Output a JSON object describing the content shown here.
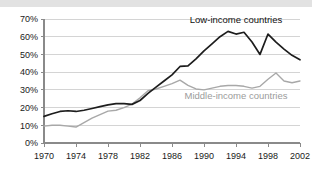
{
  "chart_data": {
    "type": "line",
    "title": "",
    "xlabel": "",
    "ylabel": "",
    "xlim": [
      1970,
      2002
    ],
    "ylim": [
      0,
      70
    ],
    "grid": true,
    "legend_position": "inline-annotation",
    "y_ticks": [
      "0%",
      "10%",
      "20%",
      "30%",
      "40%",
      "50%",
      "60%",
      "70%"
    ],
    "y_tick_values": [
      0,
      10,
      20,
      30,
      40,
      50,
      60,
      70
    ],
    "x_ticks": [
      "1970",
      "1974",
      "1978",
      "1982",
      "1986",
      "1990",
      "1994",
      "1998",
      "2002"
    ],
    "x_tick_values": [
      1970,
      1974,
      1978,
      1982,
      1986,
      1990,
      1994,
      1998,
      2002
    ],
    "x": [
      1970,
      1971,
      1972,
      1973,
      1974,
      1975,
      1976,
      1977,
      1978,
      1979,
      1980,
      1981,
      1982,
      1983,
      1984,
      1985,
      1986,
      1987,
      1988,
      1989,
      1990,
      1991,
      1992,
      1993,
      1994,
      1995,
      1996,
      1997,
      1998,
      1999,
      2000,
      2001,
      2002
    ],
    "series": [
      {
        "name": "Low-income countries",
        "color": "#1d1d1d",
        "values": [
          15.0,
          16.5,
          17.8,
          18.2,
          17.8,
          18.5,
          19.5,
          20.5,
          21.5,
          22.2,
          22.2,
          21.8,
          24.0,
          28.0,
          31.5,
          35.0,
          38.5,
          43.2,
          43.5,
          47.5,
          52.0,
          56.0,
          60.0,
          63.0,
          61.5,
          62.5,
          57.0,
          50.0,
          61.5,
          57.0,
          53.0,
          49.5,
          47.0
        ]
      },
      {
        "name": "Middle-income countries",
        "color": "#a8a8a8",
        "values": [
          9.5,
          10.0,
          10.0,
          9.5,
          9.0,
          11.5,
          14.0,
          16.0,
          18.0,
          18.5,
          20.0,
          22.0,
          25.5,
          29.5,
          30.5,
          32.0,
          33.5,
          35.5,
          32.5,
          30.5,
          30.0,
          31.0,
          32.0,
          32.5,
          32.5,
          32.0,
          31.0,
          32.0,
          36.0,
          39.5,
          35.0,
          34.0,
          35.0
        ]
      }
    ],
    "annotations": [
      {
        "text": "Low-income countries",
        "series": "low",
        "x": 1994,
        "y": 68
      },
      {
        "text": "Middle-income countries",
        "series": "mid",
        "x": 1994,
        "y": 25
      }
    ]
  }
}
